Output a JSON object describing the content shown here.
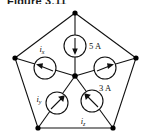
{
  "figure": {
    "caption": "Figure 3.11",
    "type": "circuit-diagram"
  },
  "colors": {
    "line": "#111111",
    "node": "#000000",
    "background": "#ffffff",
    "text": "#111111"
  },
  "geometry": {
    "vertices": [
      {
        "name": "top",
        "x": 75,
        "y": 13
      },
      {
        "name": "right",
        "x": 136,
        "y": 58
      },
      {
        "name": "bottom-right",
        "x": 113,
        "y": 128
      },
      {
        "name": "bottom-left",
        "x": 38,
        "y": 128
      },
      {
        "name": "left",
        "x": 15,
        "y": 58
      }
    ],
    "center": {
      "x": 75,
      "y": 76
    },
    "meter_radius": 11
  },
  "meters": [
    {
      "id": "meter-top",
      "label": "5 A",
      "label_kind": "value",
      "cx": 75,
      "cy": 46,
      "arrow": "down",
      "label_x": 89,
      "label_y": 49
    },
    {
      "id": "meter-left",
      "label": "i",
      "label_sub": "x",
      "label_kind": "variable",
      "cx": 45,
      "cy": 68,
      "arrow": "left",
      "label_x": 42,
      "label_y": 52
    },
    {
      "id": "meter-right",
      "label": "3 A",
      "label_kind": "value",
      "cx": 105,
      "cy": 68,
      "arrow": "right",
      "label_x": 99,
      "label_y": 90
    },
    {
      "id": "meter-lower-left",
      "label": "i",
      "label_sub": "y",
      "label_kind": "variable",
      "cx": 57,
      "cy": 103,
      "arrow": "up-right",
      "label_x": 39,
      "label_y": 102
    },
    {
      "id": "meter-lower-right",
      "label": "i",
      "label_sub": "z",
      "label_kind": "variable",
      "cx": 92,
      "cy": 101,
      "arrow": "up-left",
      "label_x": 81,
      "label_y": 123
    }
  ],
  "currents": {
    "known": [
      {
        "label": "5 A",
        "branch": "top",
        "direction": "into-center"
      },
      {
        "label": "3 A",
        "branch": "right",
        "direction": "out-of-center"
      }
    ],
    "unknown": [
      {
        "label": "ix",
        "branch": "left"
      },
      {
        "label": "iy",
        "branch": "lower-left"
      },
      {
        "label": "iz",
        "branch": "lower-right"
      }
    ]
  }
}
